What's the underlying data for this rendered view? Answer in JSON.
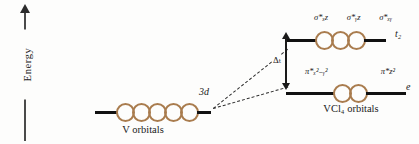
{
  "figure": {
    "type": "molecular-orbital-energy-level-diagram",
    "background_color": "#fdfdfc",
    "orbital_circle_color": "#a97c4e",
    "level_line_color": "#111111"
  },
  "axis": {
    "label": "Energy",
    "direction": "up",
    "arrow_icon": "up-arrow-icon"
  },
  "left_group": {
    "caption": "V orbitals",
    "level_label": "3d",
    "orbital_count": 5,
    "circles": [
      "",
      "",
      "",
      "",
      ""
    ]
  },
  "right_group": {
    "caption": "VCl₄ orbitals",
    "levels": [
      {
        "symmetry_label": "t₂",
        "orbital_count": 3,
        "orbital_labels": [
          "σ*ₓz",
          "σ*ᵧz",
          "σ*ₓᵧ"
        ],
        "circles": [
          "",
          "",
          ""
        ]
      },
      {
        "symmetry_label": "e",
        "orbital_count": 2,
        "orbital_labels": [
          "π*ₓ²₋ᵧ²",
          "π*z²"
        ],
        "circles": [
          "",
          ""
        ]
      }
    ]
  },
  "splitting": {
    "label": "Δₜ",
    "arrow_icon": "double-headed-vertical-arrow-icon",
    "from_level": "e",
    "to_level": "t₂"
  }
}
